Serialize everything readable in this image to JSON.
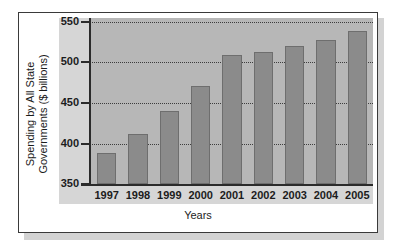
{
  "chart_data": {
    "type": "bar",
    "title": "",
    "xlabel": "Years",
    "ylabel": "Spending by All State Governments ($ billions)",
    "ylabel_line1": "Spending by All State",
    "ylabel_line2": "Governments ($ billions)",
    "categories": [
      "1997",
      "1998",
      "1999",
      "2000",
      "2001",
      "2002",
      "2003",
      "2004",
      "2005"
    ],
    "values": [
      388,
      411,
      439,
      470,
      508,
      512,
      519,
      527,
      538
    ],
    "ylim": [
      350,
      550
    ],
    "yticks": [
      350,
      400,
      450,
      500,
      550
    ],
    "ytick_labels": [
      "350",
      "400",
      "450",
      "500",
      "550"
    ],
    "grid": true,
    "grid_style": "dotted",
    "legend": "none",
    "series": [
      {
        "name": "Spending by All State Governments",
        "values": [
          388,
          411,
          439,
          470,
          508,
          512,
          519,
          527,
          538
        ]
      }
    ]
  },
  "colors": {
    "bar_fill": "#8b8b8b",
    "bar_edge": "#6e6e6e",
    "plot_background": "#b7b7b7",
    "label_band": "#d6d6d6",
    "axis": "#2b2b2b",
    "frame_border": "#3a3a3a",
    "page_background": "#ffffff",
    "shadow": "#d3d3d3",
    "text": "#1c1c1c"
  }
}
